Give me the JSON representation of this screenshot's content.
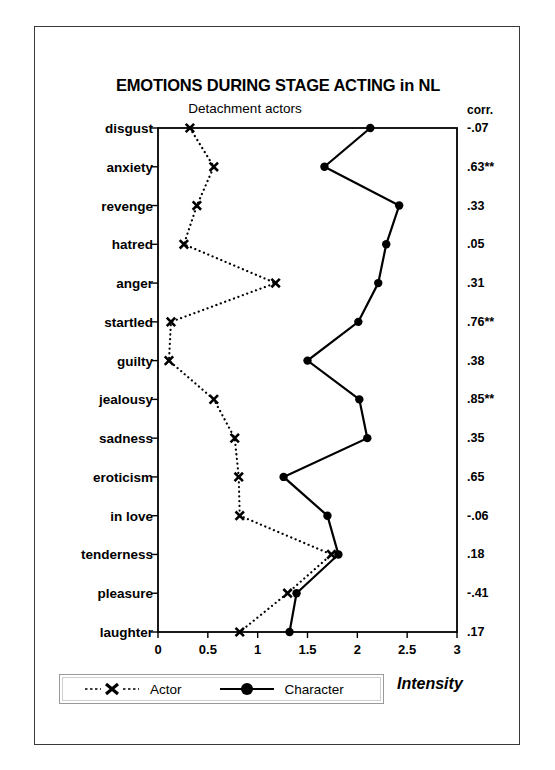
{
  "figure": {
    "title": "EMOTIONS DURING STAGE ACTING in NL",
    "subtitle": "Detachment actors",
    "corr_header": "corr.",
    "axis_title": "Intensity"
  },
  "legend": {
    "position": "bottom-left",
    "entries": [
      {
        "label": "Actor",
        "marker": "x-marker",
        "line": "dotted"
      },
      {
        "label": "Character",
        "marker": "filled-circle",
        "line": "solid"
      }
    ]
  },
  "chart_data": {
    "type": "line",
    "title": "EMOTIONS DURING STAGE ACTING in NL",
    "subtitle": "Detachment actors",
    "xlabel": "Intensity",
    "ylabel": "",
    "orientation": "horizontal",
    "xlim": [
      0,
      3
    ],
    "xticks": [
      "0",
      "0.5",
      "1",
      "1.5",
      "2",
      "2.5",
      "3"
    ],
    "xtick_values": [
      0,
      0.5,
      1,
      1.5,
      2,
      2.5,
      3
    ],
    "grid": false,
    "categories": [
      "disgust",
      "anxiety",
      "revenge",
      "hatred",
      "anger",
      "startled",
      "guilty",
      "jealousy",
      "sadness",
      "eroticism",
      "in love",
      "tenderness",
      "pleasure",
      "laughter"
    ],
    "series": [
      {
        "name": "Actor",
        "marker": "x",
        "linestyle": "dotted",
        "values": [
          0.32,
          0.56,
          0.39,
          0.26,
          1.18,
          0.13,
          0.11,
          0.56,
          0.77,
          0.81,
          0.82,
          1.74,
          1.3,
          0.82
        ]
      },
      {
        "name": "Character",
        "marker": "o",
        "linestyle": "solid",
        "values": [
          2.13,
          1.67,
          2.42,
          2.29,
          2.21,
          2.01,
          1.5,
          2.02,
          2.1,
          1.26,
          1.7,
          1.81,
          1.39,
          1.32
        ]
      }
    ],
    "annotations": {
      "column_header": "corr.",
      "correlations": [
        "-.07",
        ".63**",
        ".33",
        ".05",
        ".31",
        ".76**",
        ".38",
        ".85**",
        ".35",
        ".65",
        "-.06",
        ".18",
        "-.41",
        ".17"
      ]
    }
  }
}
